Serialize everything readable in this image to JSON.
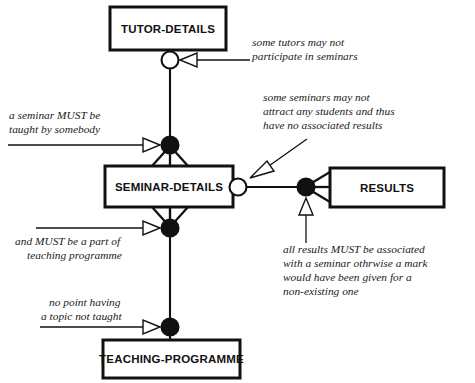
{
  "diagram": {
    "colors": {
      "stroke": "#111111",
      "fill": "#ffffff",
      "text": "#1a1a1a"
    },
    "entities": [
      {
        "id": "tutor-details",
        "label": "TUTOR-DETAILS"
      },
      {
        "id": "seminar-details",
        "label": "SEMINAR-DETAILS"
      },
      {
        "id": "results",
        "label": "RESULTS"
      },
      {
        "id": "teaching-programme",
        "label": "TEACHING-PROGRAMME"
      }
    ],
    "notes": [
      {
        "id": "note-tutors-optional",
        "lines": [
          "some tutors may not",
          "participate in seminars"
        ]
      },
      {
        "id": "note-seminars-optional",
        "lines": [
          "some seminars may not",
          "attract any students and thus",
          "have no associated results"
        ]
      },
      {
        "id": "note-seminar-must-be-taught",
        "lines": [
          "a seminar MUST be",
          "taught by somebody"
        ]
      },
      {
        "id": "note-must-be-part-of-programme",
        "lines": [
          "and MUST be a part of",
          "teaching programme"
        ]
      },
      {
        "id": "note-no-point-having-topic",
        "lines": [
          "no point having",
          "a topic not taught"
        ]
      },
      {
        "id": "note-results-must-be-associated",
        "lines": [
          "all results MUST be associated",
          "with a seminar othrwise a mark",
          "would have been given for a",
          "non-existing one"
        ]
      }
    ],
    "markers": [
      {
        "id": "optional-tutor-seminar",
        "type": "optionality-circle-open"
      },
      {
        "id": "mandatory-seminar-tutor",
        "type": "mandatory-circle-filled"
      },
      {
        "id": "optional-seminar-results",
        "type": "optionality-circle-open"
      },
      {
        "id": "mandatory-results-seminar",
        "type": "mandatory-circle-filled"
      },
      {
        "id": "mandatory-seminar-programme",
        "type": "mandatory-circle-filled"
      },
      {
        "id": "mandatory-programme-seminar",
        "type": "mandatory-circle-filled"
      }
    ]
  }
}
